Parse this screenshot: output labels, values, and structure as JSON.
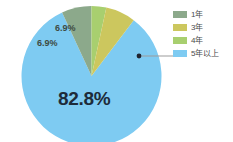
{
  "chart_data": {
    "type": "pie",
    "title": "",
    "subtitle": "",
    "xlabel": "",
    "ylabel": "",
    "legend_position": "right",
    "grid": false,
    "categories": [
      "1年",
      "3年",
      "4年",
      "5年以上"
    ],
    "values": [
      6.9,
      6.9,
      3.4,
      82.8
    ],
    "value_suffix": "%",
    "colors": [
      "#8ca98b",
      "#ccc75e",
      "#a8cf6f",
      "#7ecbf2"
    ],
    "series": [
      {
        "name": "勤続年数",
        "values": [
          6.9,
          6.9,
          3.4,
          82.8
        ]
      }
    ],
    "slices": [
      {
        "label": "1年",
        "value": 6.9,
        "display": "6.9%",
        "color": "#8ca98b",
        "labeled": true
      },
      {
        "label": "3年",
        "value": 6.9,
        "display": "6.9%",
        "color": "#ccc75e",
        "labeled": false
      },
      {
        "label": "4年",
        "value": 3.4,
        "display": "6.9%",
        "color": "#a8cf6f",
        "labeled": true
      },
      {
        "label": "5年以上",
        "value": 82.8,
        "display": "82.8%",
        "color": "#7ecbf2",
        "labeled": true
      }
    ],
    "annotations": [
      {
        "name": "callout-dot",
        "target": "5年以上"
      }
    ]
  },
  "legend": {
    "items": [
      {
        "label": "1年",
        "color": "#8ca98b"
      },
      {
        "label": "3年",
        "color": "#ccc75e"
      },
      {
        "label": "4年",
        "color": "#a8cf6f"
      },
      {
        "label": "5年以上",
        "color": "#7ecbf2"
      }
    ]
  },
  "labels": {
    "big": "82.8%",
    "small_left": "6.9%",
    "small_top": "6.9%"
  },
  "colors": {
    "background": "#ffffff",
    "label_dark": "#1d2b3a",
    "label_small": "#3d4a42",
    "legend_text": "#4b4b4b",
    "leader_line": "#9b9b9b",
    "callout_dot": "#1f2430"
  }
}
